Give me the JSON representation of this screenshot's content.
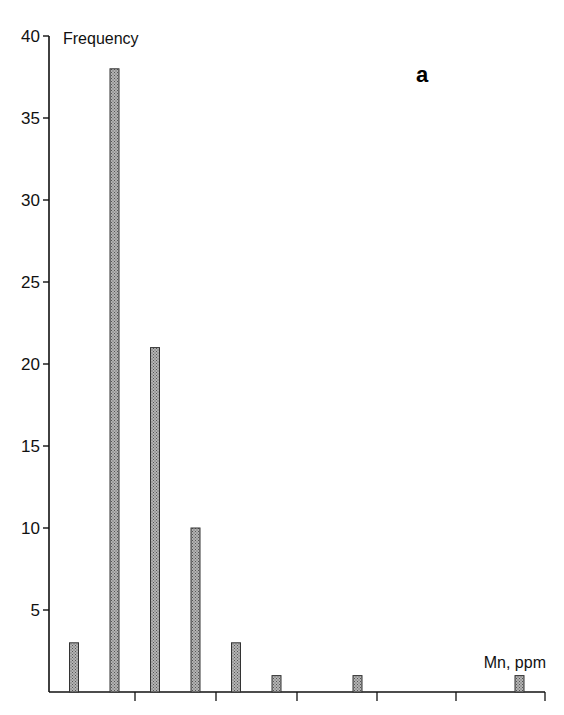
{
  "chart_data": {
    "type": "bar",
    "title": "",
    "panel_label": "a",
    "xlabel": "Mn, ppm",
    "ylabel": "Frequency",
    "categories": [
      "bin1",
      "bin2",
      "bin3",
      "bin4",
      "bin5",
      "bin6",
      "bin7",
      "bin8",
      "bin9",
      "bin10",
      "bin11",
      "bin12"
    ],
    "values": [
      3,
      38,
      21,
      10,
      3,
      1,
      0,
      1,
      0,
      0,
      0,
      1
    ],
    "ylim": [
      0,
      40
    ],
    "yticks": [
      5,
      10,
      15,
      20,
      25,
      30,
      35,
      40
    ],
    "xticks_labeled": false,
    "x_tick_count": 6,
    "grid": false,
    "legend": null,
    "colors": {
      "bar_fill": "#a6a6a6",
      "bar_stroke": "#333333",
      "axis": "#111111"
    }
  }
}
